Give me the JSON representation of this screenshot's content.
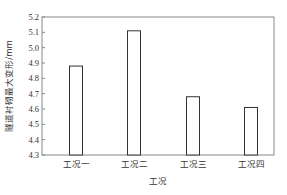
{
  "chart_data": {
    "type": "bar",
    "title": "",
    "xlabel": "工况",
    "ylabel": "隧道衬砌最大变形/mm",
    "categories": [
      "工况一",
      "工况二",
      "工况三",
      "工况四"
    ],
    "values": [
      4.88,
      5.11,
      4.68,
      4.61
    ],
    "ylim": [
      4.3,
      5.2
    ],
    "yticks": [
      "4.3",
      "4.4",
      "4.5",
      "4.6",
      "4.7",
      "4.8",
      "4.9",
      "5.0",
      "5.1",
      "5.2"
    ],
    "grid": false,
    "legend": null,
    "bar_fill": "#ffffff",
    "bar_stroke": "#333333"
  }
}
